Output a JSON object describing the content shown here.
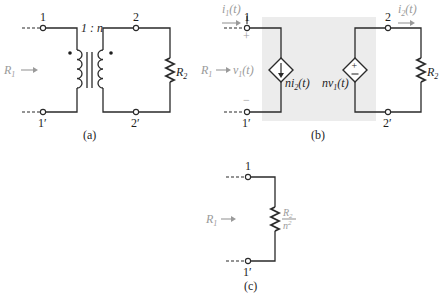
{
  "figure": {
    "panels": [
      {
        "id": "a",
        "caption": "(a)",
        "terminals": {
          "top_left": "1",
          "bottom_left": "1′",
          "top_right": "2",
          "bottom_right": "2′"
        },
        "turns_ratio": "1 : n",
        "load": "R",
        "load_sub": "2",
        "input_resistance": "R",
        "input_resistance_sub": "1"
      },
      {
        "id": "b",
        "caption": "(b)",
        "terminals": {
          "top_left": "1",
          "bottom_left": "1′",
          "top_right": "2",
          "bottom_right": "2′"
        },
        "i1": {
          "base": "i",
          "sub": "1",
          "arg": "(t)"
        },
        "i2": {
          "base": "i",
          "sub": "2",
          "arg": "(t)"
        },
        "v1": {
          "base": "v",
          "sub": "1",
          "arg": "(t)"
        },
        "plus": "+",
        "minus": "−",
        "controlled_current_source": {
          "prefix": "ni",
          "sub": "2",
          "arg": "(t)"
        },
        "controlled_voltage_source": {
          "prefix": "nv",
          "sub": "1",
          "arg": "(t)"
        },
        "load": "R",
        "load_sub": "2",
        "input_resistance": "R",
        "input_resistance_sub": "1"
      },
      {
        "id": "c",
        "caption": "(c)",
        "terminals": {
          "top_left": "1",
          "bottom_left": "1′"
        },
        "equivalent_numerator": "R",
        "equivalent_numerator_sub": "2",
        "equivalent_denominator": "n",
        "equivalent_denominator_sup": "2",
        "input_resistance": "R",
        "input_resistance_sub": "1"
      }
    ],
    "colors": {
      "line": "#2a2a2a",
      "annotation_gray": "#9a9a9a",
      "shaded_region": "#ececec"
    }
  }
}
